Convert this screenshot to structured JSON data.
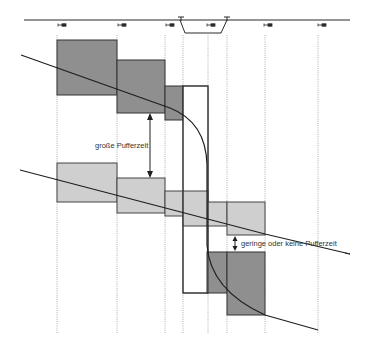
{
  "colors": {
    "dark_block": "#8f8f8f",
    "light_block": "#cfcfcf",
    "stroke": "#2a2a2a",
    "grid": "#9a9a9a"
  },
  "labels": {
    "large_buffer": "große Pufferzeit",
    "small_buffer": "geringe oder keine Pufferzeit"
  },
  "track": {
    "signals_x": [
      62,
      123,
      170,
      212,
      268,
      322
    ],
    "switches_x": [
      180,
      227
    ]
  },
  "grid_lines_x": [
    57,
    117,
    165,
    183,
    208,
    227,
    265,
    318
  ]
}
